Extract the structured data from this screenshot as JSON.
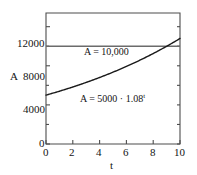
{
  "chart_data": {
    "type": "line",
    "title": "",
    "subtitle": "",
    "xlabel": "t",
    "ylabel": "A",
    "xlim": [
      0,
      10
    ],
    "ylim": [
      0,
      13400
    ],
    "grid": false,
    "legend_position": "none",
    "xticks": [
      "0",
      "2",
      "4",
      "6",
      "8",
      "10"
    ],
    "xtick_values": [
      0,
      2,
      4,
      6,
      8,
      10
    ],
    "yticks": [
      "0",
      "4000",
      "8000",
      "12000"
    ],
    "ytick_values": [
      0,
      4000,
      8000,
      12000
    ],
    "y_origin_label": "0",
    "series": [
      {
        "name": "A = 5000 · 1.08^t",
        "kind": "curve",
        "color": "#1a1a1a",
        "x": [
          0,
          1,
          2,
          3,
          4,
          5,
          6,
          7,
          8,
          9,
          10
        ],
        "values": [
          5000,
          5400,
          5832,
          6298,
          6802,
          7347,
          7934,
          8569,
          9255,
          9995,
          10795
        ]
      },
      {
        "name": "A = 10,000",
        "kind": "horizontal-line",
        "color": "#6b6b6b",
        "x": [
          0,
          10
        ],
        "values": [
          10000,
          10000
        ]
      }
    ],
    "annotations": [
      {
        "id": "constant-line-label",
        "text_prefix": "A = 10,000",
        "text_sup": "",
        "x": 4.55,
        "y": 11050
      },
      {
        "id": "exponential-curve-label",
        "text_prefix": "A = 5000 · 1.08",
        "text_sup": "t",
        "x": 4.6,
        "y": 5450
      }
    ],
    "intersection": {
      "x": 9.0,
      "y": 10000
    }
  }
}
